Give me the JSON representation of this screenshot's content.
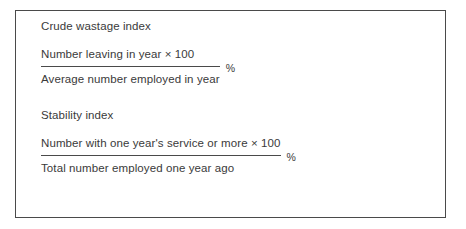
{
  "figure": {
    "border_color": "#4a4a4a",
    "text_color": "#3a3a3a",
    "background_color": "#ffffff",
    "blocks": [
      {
        "heading": "Crude wastage index",
        "numerator": "Number leaving in year × 100",
        "denominator": "Average number employed in year",
        "unit": "%"
      },
      {
        "heading": "Stability index",
        "numerator": "Number with one year's service or more × 100",
        "denominator": "Total number employed one year ago",
        "unit": "%"
      }
    ]
  }
}
